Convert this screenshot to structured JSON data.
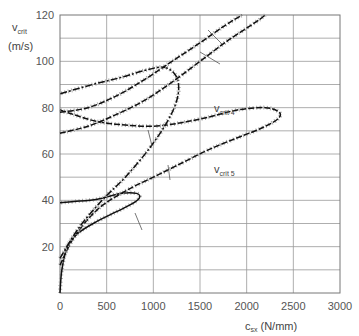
{
  "chart_data": {
    "type": "line",
    "title": "",
    "xlabel": "c_sx (N/mm)",
    "xlabel_main": "c",
    "xlabel_sub": "sx",
    "xlabel_unit": "(N/mm)",
    "ylabel": "v_crit (m/s)",
    "ylabel_main": "v",
    "ylabel_sub": "crit",
    "ylabel_unit": "(m/s)",
    "xlim": [
      0,
      3000
    ],
    "ylim": [
      0,
      120
    ],
    "grid": true,
    "x_ticks": [
      "0",
      "500",
      "1000",
      "1500",
      "2000",
      "2500",
      "3000"
    ],
    "y_ticks": [
      "20",
      "40",
      "60",
      "80",
      "100",
      "120"
    ],
    "series": [
      {
        "name": "v_crit 1",
        "label_main": "v",
        "label_sub": "crit 1",
        "points": [
          [
            0,
            0
          ],
          [
            20,
            10
          ],
          [
            80,
            20
          ],
          [
            200,
            26
          ],
          [
            400,
            31
          ],
          [
            600,
            35
          ],
          [
            750,
            38
          ],
          [
            850,
            41
          ],
          [
            820,
            43
          ],
          [
            650,
            43
          ],
          [
            400,
            40.5
          ],
          [
            150,
            39.5
          ],
          [
            0,
            39
          ]
        ],
        "label_pos": [
          350,
          236
        ],
        "leader": [
          [
            135,
            213
          ],
          [
            142,
            230
          ]
        ]
      },
      {
        "name": "v_crit 2",
        "label_main": "v",
        "label_sub": "crit 2",
        "points": [
          [
            0,
            12
          ],
          [
            150,
            24
          ],
          [
            400,
            36
          ],
          [
            700,
            44
          ],
          [
            1000,
            50
          ],
          [
            1300,
            56
          ],
          [
            1600,
            62
          ],
          [
            1900,
            67
          ],
          [
            2150,
            71
          ],
          [
            2330,
            75
          ],
          [
            2350,
            78
          ],
          [
            2200,
            80
          ],
          [
            1900,
            79
          ],
          [
            1600,
            76
          ],
          [
            1300,
            73.5
          ],
          [
            1000,
            72
          ],
          [
            700,
            72.5
          ],
          [
            400,
            74
          ],
          [
            150,
            77
          ],
          [
            0,
            79
          ]
        ],
        "label_pos": [
          1150,
          190
        ],
        "leader": [
          [
            168,
            165
          ],
          [
            170,
            180
          ]
        ]
      },
      {
        "name": "v_crit 3",
        "label_main": "v",
        "label_sub": "crit 3",
        "points": [
          [
            0,
            15
          ],
          [
            200,
            28
          ],
          [
            450,
            40
          ],
          [
            700,
            50
          ],
          [
            950,
            62
          ],
          [
            1150,
            74
          ],
          [
            1250,
            83
          ],
          [
            1270,
            90
          ],
          [
            1220,
            95
          ],
          [
            1100,
            97.5
          ],
          [
            900,
            96
          ],
          [
            650,
            93
          ],
          [
            350,
            90
          ],
          [
            0,
            86
          ]
        ],
        "label_pos": [
          1050,
          150
        ],
        "leader": [
          [
            148,
            130
          ],
          [
            152,
            146
          ]
        ]
      },
      {
        "name": "v_crit 4",
        "label_main": "v",
        "label_sub": "crit 4",
        "points": [
          [
            0,
            69
          ],
          [
            300,
            72
          ],
          [
            600,
            77
          ],
          [
            900,
            83
          ],
          [
            1200,
            91
          ],
          [
            1500,
            100
          ],
          [
            1800,
            109
          ],
          [
            2100,
            117
          ],
          [
            2200,
            120
          ]
        ],
        "label_pos": [
          1650,
          78
        ],
        "leader": [
          [
            200,
            52
          ],
          [
            220,
            64
          ]
        ]
      },
      {
        "name": "v_crit 5",
        "label_main": "v",
        "label_sub": "crit 5",
        "points": [
          [
            0,
            78
          ],
          [
            300,
            80
          ],
          [
            600,
            85
          ],
          [
            900,
            92
          ],
          [
            1200,
            100
          ],
          [
            1500,
            108
          ],
          [
            1750,
            115
          ],
          [
            1950,
            120
          ]
        ],
        "label_pos": [
          1650,
          52
        ],
        "leader": [
          [
            208,
            30
          ],
          [
            222,
            44
          ]
        ]
      }
    ]
  }
}
